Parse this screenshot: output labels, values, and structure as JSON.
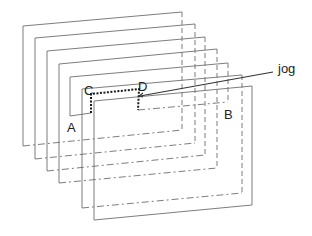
{
  "diagram": {
    "layer_count": 8,
    "labels": {
      "a": "A",
      "b": "B",
      "c": "C",
      "d": "D",
      "jog": "jog"
    },
    "colors": {
      "layer_stroke": "#6e6e6e",
      "route_stroke": "#1a1a1a",
      "text": "#222222",
      "background": "#ffffff"
    }
  }
}
